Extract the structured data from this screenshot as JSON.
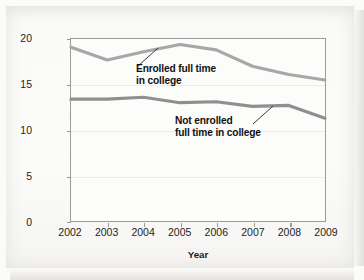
{
  "chart_data": {
    "type": "line",
    "title": "",
    "subtitle": "",
    "xlabel": "Year",
    "ylabel": "Percentage using in past month",
    "categories": [
      "2002",
      "2003",
      "2004",
      "2005",
      "2006",
      "2007",
      "2008",
      "2009"
    ],
    "x": [
      2002,
      2003,
      2004,
      2005,
      2006,
      2007,
      2008,
      2009
    ],
    "xlim": [
      2002,
      2009
    ],
    "ylim": [
      0,
      20
    ],
    "yticks": [
      0,
      5,
      10,
      15,
      20
    ],
    "ytick_labels": [
      "0",
      "5",
      "10",
      "15",
      "20"
    ],
    "grid": true,
    "legend": "none",
    "series": [
      {
        "name": "Enrolled full time in college",
        "color": "#a7a7a7",
        "values": [
          19.1,
          17.7,
          18.6,
          19.4,
          18.8,
          17.0,
          16.1,
          15.5
        ]
      },
      {
        "name": "Not enrolled full time in college",
        "color": "#8f8f8f",
        "values": [
          13.4,
          13.4,
          13.6,
          13.0,
          13.1,
          12.6,
          12.7,
          11.3
        ]
      }
    ],
    "annotations": [
      {
        "text": "Enrolled full time\nin college",
        "series": "Enrolled full time in college"
      },
      {
        "text": "Not enrolled\nfull time in college",
        "series": "Not enrolled full time in college"
      }
    ]
  },
  "axes": {
    "xlabel": "Year",
    "ylabel": "Percentage using in past month",
    "ytick_labels": [
      "20",
      "15",
      "10",
      "5",
      "0"
    ],
    "xtick_labels": [
      "2002",
      "2003",
      "2004",
      "2005",
      "2006",
      "2007",
      "2008",
      "2009"
    ]
  },
  "annotations": {
    "enrolled": "Enrolled full time\nin college",
    "not_enrolled": "Not enrolled\nfull time in college"
  },
  "colors": {
    "line_upper": "#a7a7a7",
    "line_lower": "#8f8f8f",
    "frame": "#9a9a98",
    "plot_background": "#fcfcfb",
    "page_background": "#fbfbfa",
    "text": "#231f20"
  }
}
